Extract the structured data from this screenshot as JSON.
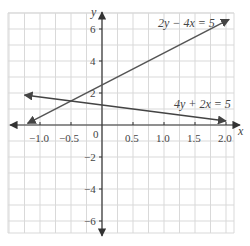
{
  "chart_data": {
    "type": "line",
    "title": "",
    "xlabel": "x",
    "ylabel": "y",
    "xlim": [
      -1.25,
      2.15
    ],
    "ylim": [
      -6.8,
      6.8
    ],
    "grid": true,
    "grid_x_step": 0.25,
    "grid_y_step": 1,
    "x_ticks": [
      {
        "value": -1.0,
        "label": "−1.0"
      },
      {
        "value": -0.5,
        "label": "−0.5"
      },
      {
        "value": 0.5,
        "label": "0.5"
      },
      {
        "value": 1.0,
        "label": "1.0"
      },
      {
        "value": 1.5,
        "label": "1.5"
      },
      {
        "value": 2.0,
        "label": "2.0"
      }
    ],
    "y_ticks": [
      {
        "value": 6,
        "label": "6"
      },
      {
        "value": 4,
        "label": "4"
      },
      {
        "value": 2,
        "label": "2"
      },
      {
        "value": -2,
        "label": "−2"
      },
      {
        "value": -4,
        "label": "−4"
      },
      {
        "value": -6,
        "label": "−6"
      }
    ],
    "origin_label": "0",
    "series": [
      {
        "name": "2y − 4x = 5",
        "equation": "y = 2x + 2.5",
        "slope": 2,
        "intercept": 2.5,
        "x": [
          -1.2,
          2.05
        ],
        "y": [
          0.1,
          6.6
        ],
        "color": "#555555",
        "label_pos": {
          "x": 1.2,
          "y": 6.2
        }
      },
      {
        "name": "4y + 2x = 5",
        "equation": "y = 1.25 − 0.5x",
        "slope": -0.5,
        "intercept": 1.25,
        "x": [
          -1.25,
          2.0
        ],
        "y": [
          1.875,
          0.25
        ],
        "color": "#444444",
        "label_pos": {
          "x": 1.35,
          "y": 1.5
        }
      }
    ],
    "annotations": [
      {
        "text": "2y − 4x = 5",
        "near": "upper line, top right"
      },
      {
        "text": "4y + 2x = 5",
        "near": "lower line, right"
      }
    ],
    "intersection": {
      "x": -0.5,
      "y": 1.5
    }
  },
  "labels": {
    "x_axis": "x",
    "y_axis": "y",
    "origin": "0",
    "eq1": "2y − 4x = 5",
    "eq2": "4y + 2x = 5",
    "xt0": "−1.0",
    "xt1": "−0.5",
    "xt2": "0.5",
    "xt3": "1.0",
    "xt4": "1.5",
    "xt5": "2.0",
    "yt0": "6",
    "yt1": "4",
    "yt2": "2",
    "yt3": "−2",
    "yt4": "−4",
    "yt5": "−6"
  },
  "colors": {
    "grid": "#d9d9d9",
    "axis": "#333333",
    "line": "#4a4a4a",
    "text": "#444444"
  }
}
